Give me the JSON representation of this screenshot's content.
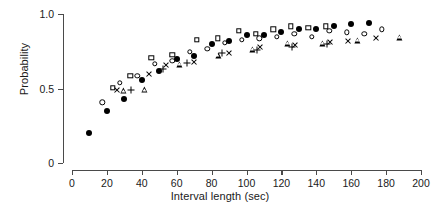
{
  "chart_data": {
    "type": "scatter",
    "title": "",
    "xlabel": "Interval length (sec)",
    "ylabel": "Probability",
    "xlim": [
      0,
      200
    ],
    "ylim": [
      0,
      1.0
    ],
    "xticks": [
      0,
      20,
      40,
      60,
      80,
      100,
      120,
      140,
      160,
      180,
      200
    ],
    "xticklabels": [
      "0",
      "20",
      "40",
      "60",
      "80",
      "100",
      "120",
      "140",
      "160",
      "180",
      "200"
    ],
    "yticks": [
      0,
      0.5,
      1.0
    ],
    "yticklabels": [
      "0",
      "0.5",
      "1.0"
    ],
    "grid": false,
    "legend": "none",
    "series": [
      {
        "name": "filled-circle",
        "marker": "filled-circle",
        "points": [
          {
            "x": 10,
            "y": 0.2
          },
          {
            "x": 20,
            "y": 0.35
          },
          {
            "x": 30,
            "y": 0.43
          },
          {
            "x": 40,
            "y": 0.56
          },
          {
            "x": 50,
            "y": 0.62
          },
          {
            "x": 60,
            "y": 0.7
          },
          {
            "x": 70,
            "y": 0.72
          },
          {
            "x": 80,
            "y": 0.8
          },
          {
            "x": 90,
            "y": 0.82
          },
          {
            "x": 100,
            "y": 0.86
          },
          {
            "x": 110,
            "y": 0.86
          },
          {
            "x": 120,
            "y": 0.88
          },
          {
            "x": 130,
            "y": 0.9
          },
          {
            "x": 140,
            "y": 0.9
          },
          {
            "x": 150,
            "y": 0.92
          },
          {
            "x": 160,
            "y": 0.93
          },
          {
            "x": 170,
            "y": 0.94
          }
        ]
      },
      {
        "name": "open-circle",
        "marker": "open-circle",
        "points": [
          {
            "x": 18,
            "y": 0.4
          },
          {
            "x": 28,
            "y": 0.53
          },
          {
            "x": 38,
            "y": 0.58
          },
          {
            "x": 48,
            "y": 0.66
          },
          {
            "x": 58,
            "y": 0.68
          },
          {
            "x": 68,
            "y": 0.74
          },
          {
            "x": 78,
            "y": 0.76
          },
          {
            "x": 88,
            "y": 0.8
          },
          {
            "x": 98,
            "y": 0.82
          },
          {
            "x": 108,
            "y": 0.83
          },
          {
            "x": 118,
            "y": 0.84
          },
          {
            "x": 128,
            "y": 0.86
          },
          {
            "x": 138,
            "y": 0.84
          },
          {
            "x": 148,
            "y": 0.88
          },
          {
            "x": 158,
            "y": 0.87
          },
          {
            "x": 168,
            "y": 0.86
          },
          {
            "x": 178,
            "y": 0.89
          }
        ]
      },
      {
        "name": "open-square",
        "marker": "open-square",
        "points": [
          {
            "x": 24,
            "y": 0.5
          },
          {
            "x": 34,
            "y": 0.58
          },
          {
            "x": 46,
            "y": 0.7
          },
          {
            "x": 58,
            "y": 0.72
          },
          {
            "x": 72,
            "y": 0.82
          },
          {
            "x": 84,
            "y": 0.83
          },
          {
            "x": 96,
            "y": 0.88
          },
          {
            "x": 106,
            "y": 0.86
          },
          {
            "x": 116,
            "y": 0.89
          },
          {
            "x": 126,
            "y": 0.91
          },
          {
            "x": 136,
            "y": 0.9
          },
          {
            "x": 146,
            "y": 0.91
          }
        ]
      },
      {
        "name": "triangle",
        "marker": "triangle",
        "points": [
          {
            "x": 30,
            "y": 0.48
          },
          {
            "x": 42,
            "y": 0.49
          },
          {
            "x": 62,
            "y": 0.66
          },
          {
            "x": 84,
            "y": 0.72
          },
          {
            "x": 104,
            "y": 0.76
          },
          {
            "x": 124,
            "y": 0.8
          },
          {
            "x": 144,
            "y": 0.8
          },
          {
            "x": 164,
            "y": 0.82
          },
          {
            "x": 188,
            "y": 0.84
          }
        ]
      },
      {
        "name": "cross",
        "marker": "cross",
        "points": [
          {
            "x": 26,
            "y": 0.49
          },
          {
            "x": 44,
            "y": 0.6
          },
          {
            "x": 54,
            "y": 0.66
          },
          {
            "x": 70,
            "y": 0.68
          },
          {
            "x": 90,
            "y": 0.74
          },
          {
            "x": 108,
            "y": 0.78
          },
          {
            "x": 128,
            "y": 0.79
          },
          {
            "x": 148,
            "y": 0.81
          },
          {
            "x": 158,
            "y": 0.82
          },
          {
            "x": 174,
            "y": 0.84
          }
        ]
      },
      {
        "name": "plus",
        "marker": "plus",
        "points": [
          {
            "x": 34,
            "y": 0.49
          },
          {
            "x": 52,
            "y": 0.63
          },
          {
            "x": 66,
            "y": 0.67
          },
          {
            "x": 86,
            "y": 0.74
          },
          {
            "x": 106,
            "y": 0.76
          },
          {
            "x": 126,
            "y": 0.78
          },
          {
            "x": 146,
            "y": 0.8
          }
        ]
      }
    ]
  },
  "axes": {
    "x_axis_name": "x-axis",
    "y_axis_name": "y-axis"
  }
}
